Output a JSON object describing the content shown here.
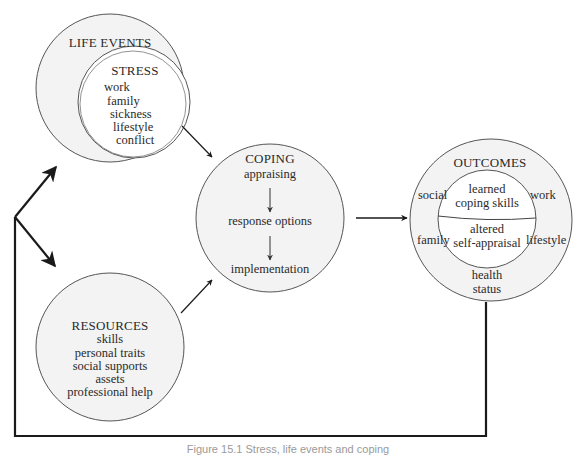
{
  "diagram": {
    "life_events": {
      "title": "LIFE EVENTS",
      "stress": {
        "title": "STRESS",
        "items": [
          "work",
          "family",
          "sickness",
          "lifestyle",
          "conflict"
        ]
      }
    },
    "resources": {
      "title": "RESOURCES",
      "items": [
        "skills",
        "personal traits",
        "social supports",
        "assets",
        "professional help"
      ]
    },
    "coping": {
      "title": "COPING",
      "steps": [
        "appraising",
        "response options",
        "implementation"
      ]
    },
    "outcomes": {
      "title": "OUTCOMES",
      "outer_items": {
        "social": "social",
        "work": "work",
        "family": "family",
        "lifestyle": "lifestyle",
        "health": "health",
        "status": "status"
      },
      "inner_top": [
        "learned",
        "coping skills"
      ],
      "inner_bottom": [
        "altered",
        "self-appraisal"
      ]
    },
    "caption": "Figure 15.1 Stress, life events and coping"
  },
  "colors": {
    "circle_fill": "#f3f3f3",
    "inner_fill": "#ffffff",
    "stroke": "#555555",
    "arrow": "#1a1a1a"
  }
}
